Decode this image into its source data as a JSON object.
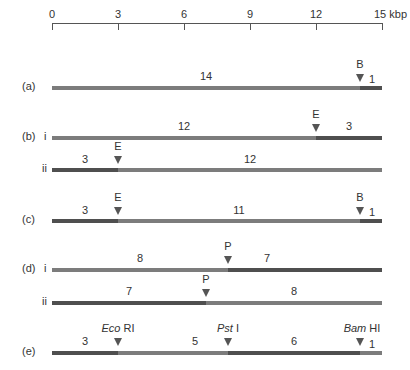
{
  "scale": {
    "ticks": [
      "0",
      "3",
      "6",
      "9",
      "12",
      "15 kbp"
    ],
    "unit": "kbp"
  },
  "rows": {
    "a": {
      "label": "(a)",
      "sub": "",
      "fragments": [
        "14",
        "1"
      ],
      "sites": [
        "B"
      ]
    },
    "b_i": {
      "label": "(b)",
      "sub": "i",
      "fragments": [
        "12",
        "3"
      ],
      "sites": [
        "E"
      ]
    },
    "b_ii": {
      "label": "",
      "sub": "ii",
      "fragments": [
        "3",
        "12"
      ],
      "sites": [
        "E"
      ]
    },
    "c": {
      "label": "(c)",
      "sub": "",
      "fragments": [
        "3",
        "11",
        "1"
      ],
      "sites": [
        "E",
        "B"
      ]
    },
    "d_i": {
      "label": "(d)",
      "sub": "i",
      "fragments": [
        "8",
        "7"
      ],
      "sites": [
        "P"
      ]
    },
    "d_ii": {
      "label": "",
      "sub": "ii",
      "fragments": [
        "7",
        "8"
      ],
      "sites": [
        "P"
      ]
    },
    "e": {
      "label": "(e)",
      "sub": "",
      "fragments": [
        "3",
        "5",
        "6",
        "1"
      ],
      "sites": [
        {
          "italic": "Eco",
          "rest": " RI"
        },
        {
          "italic": "Pst",
          "rest": " I"
        },
        {
          "italic": "Bam",
          "rest": " HI"
        }
      ]
    }
  },
  "colors": {
    "light_segment": "#7c7c7c",
    "dark_segment": "#4f4f4f",
    "axis": "#555555"
  }
}
